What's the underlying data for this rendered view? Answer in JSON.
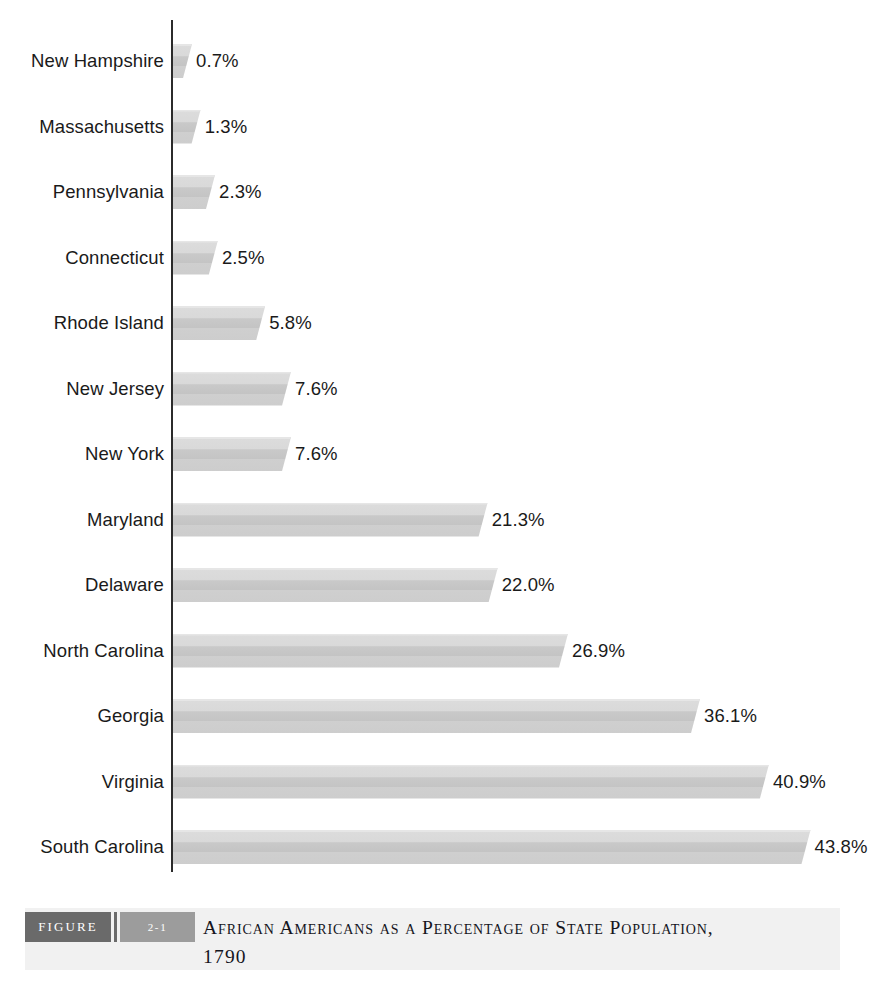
{
  "chart_data": {
    "type": "bar",
    "orientation": "horizontal",
    "title": "African Americans as a Percentage of State Population,",
    "subtitle": "1790",
    "xlabel": "",
    "ylabel": "",
    "xlim": [
      0,
      44
    ],
    "grid": false,
    "legend": null,
    "value_suffix": "%",
    "categories": [
      "New Hampshire",
      "Massachusetts",
      "Pennsylvania",
      "Connecticut",
      "Rhode Island",
      "New Jersey",
      "New York",
      "Maryland",
      "Delaware",
      "North Carolina",
      "Georgia",
      "Virginia",
      "South Carolina"
    ],
    "values": [
      0.7,
      1.3,
      2.3,
      2.5,
      5.8,
      7.6,
      7.6,
      21.3,
      22.0,
      26.9,
      36.1,
      40.9,
      43.8
    ],
    "value_labels": [
      "0.7%",
      "1.3%",
      "2.3%",
      "2.5%",
      "5.8%",
      "7.6%",
      "7.6%",
      "21.3%",
      "22.0%",
      "26.9%",
      "36.1%",
      "40.9%",
      "43.8%"
    ],
    "bar_style": "3d-gradient-gray",
    "colors": {
      "bar_top": "#dcdcdc",
      "bar_bottom": "#c6c6c6",
      "axis": "#2b2b2b",
      "text": "#1a1a1a",
      "background": "#ffffff"
    }
  },
  "caption": {
    "figure_label": "FIGURE",
    "figure_number": "2-1",
    "title_line1": "African Americans as a Percentage of State Population,",
    "title_line2": "1790",
    "band_color": "#f1f1f1",
    "figure_box_color": "#6a6a6a",
    "number_box_color": "#9c9c9c"
  }
}
